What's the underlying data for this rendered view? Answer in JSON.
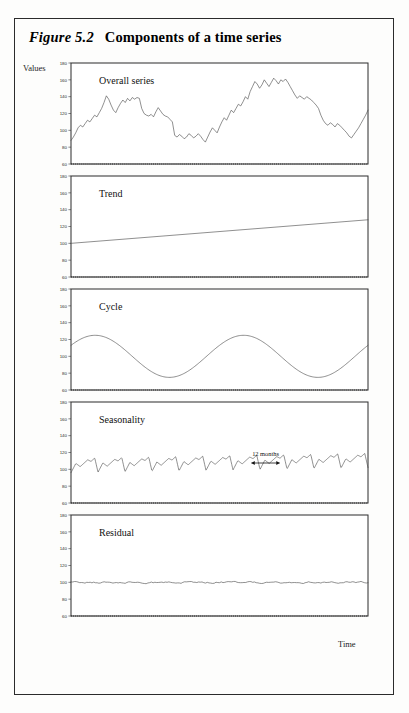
{
  "figure": {
    "number": "Figure 5.2",
    "caption": "Components of a time series",
    "y_axis_label": "Values",
    "x_axis_label": "Time"
  },
  "axis": {
    "ticks": [
      "180",
      "160",
      "140",
      "120",
      "100",
      "80",
      "60"
    ],
    "ymin": 60,
    "ymax": 180
  },
  "annotation": {
    "seasonality_span_label": "12 months"
  },
  "chart_data": [
    {
      "type": "line",
      "title": "Overall series",
      "xlabel": "Time",
      "ylabel": "Values",
      "ylim": [
        60,
        180
      ],
      "grid": false,
      "legend": "none",
      "values": [
        88,
        92,
        97,
        103,
        106,
        104,
        108,
        112,
        110,
        114,
        118,
        116,
        121,
        126,
        133,
        141,
        137,
        130,
        124,
        121,
        127,
        132,
        136,
        133,
        138,
        135,
        139,
        137,
        139,
        138,
        126,
        120,
        118,
        117,
        119,
        116,
        122,
        127,
        123,
        119,
        117,
        116,
        113,
        110,
        94,
        92,
        95,
        93,
        90,
        92,
        96,
        94,
        91,
        93,
        96,
        93,
        89,
        86,
        92,
        98,
        103,
        100,
        97,
        104,
        110,
        115,
        112,
        118,
        124,
        121,
        126,
        131,
        129,
        134,
        140,
        137,
        146,
        152,
        158,
        155,
        150,
        154,
        160,
        156,
        152,
        157,
        162,
        159,
        155,
        160,
        158,
        161,
        157,
        152,
        147,
        142,
        138,
        141,
        139,
        137,
        140,
        138,
        136,
        133,
        130,
        126,
        118,
        112,
        108,
        106,
        109,
        107,
        104,
        108,
        106,
        103,
        100,
        97,
        93,
        91,
        95,
        99,
        103,
        108,
        113,
        118,
        124
      ]
    },
    {
      "type": "line",
      "title": "Trend",
      "ylim": [
        60,
        180
      ],
      "grid": false,
      "legend": "none",
      "description": "linear increase",
      "values": [
        100,
        128
      ]
    },
    {
      "type": "line",
      "title": "Cycle",
      "ylim": [
        60,
        180
      ],
      "grid": false,
      "legend": "none",
      "description": "sinusoid amplitude 25 about 100, two periods",
      "amplitude": 25,
      "mean": 100,
      "periods": 2
    },
    {
      "type": "line",
      "title": "Seasonality",
      "ylim": [
        60,
        180
      ],
      "grid": false,
      "legend": "none",
      "description": "sawtooth seasonal pattern, 12-month period",
      "amplitude": 12,
      "mean": 102,
      "cycles": 11
    },
    {
      "type": "line",
      "title": "Residual",
      "ylim": [
        60,
        180
      ],
      "grid": false,
      "legend": "none",
      "description": "small random noise about 100",
      "mean": 100,
      "amplitude": 2
    }
  ]
}
